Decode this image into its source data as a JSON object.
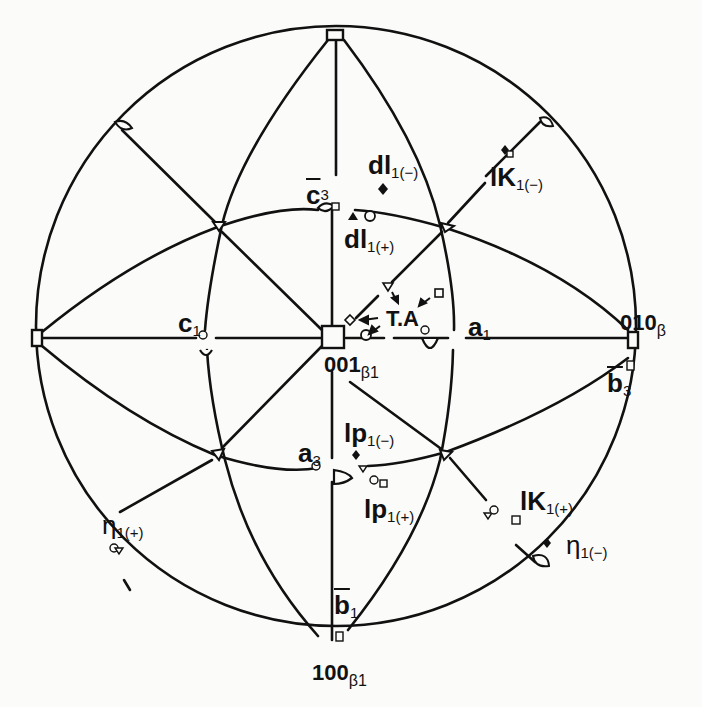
{
  "diagram": {
    "type": "stereographic-projection",
    "background_color": "#fbfbf9",
    "line_color": "#111111",
    "primitive_circle": {
      "cx": 336,
      "cy": 320,
      "r": 300
    },
    "poles": [
      {
        "id": "001",
        "main": "001",
        "sub": "β1",
        "x": 331,
        "y": 338
      },
      {
        "id": "010",
        "main": "010",
        "sub": "β",
        "x": 631,
        "y": 338
      },
      {
        "id": "100",
        "main": "100",
        "sub": "β1",
        "x": 331,
        "y": 620
      },
      {
        "id": "top",
        "x": 336,
        "y": 35
      },
      {
        "id": "left",
        "x": 36,
        "y": 338
      }
    ],
    "labels": {
      "pole_001": {
        "main": "001",
        "sub": "β1"
      },
      "pole_010": {
        "main": "010",
        "sub": "β"
      },
      "pole_100": {
        "main": "100",
        "sub": "β1"
      },
      "c3": {
        "main": "c",
        "sub": "3",
        "overbar": true
      },
      "dl1_minus": {
        "main": "dl",
        "sub": "1(−)"
      },
      "dl1_plus": {
        "main": "dl",
        "sub": "1(+)"
      },
      "K1_minus": {
        "main": "lK",
        "sub": "1(−)"
      },
      "K1_plus": {
        "main": "lK",
        "sub": "1(+)"
      },
      "c1": {
        "main": "c",
        "sub": "1"
      },
      "a1": {
        "main": "a",
        "sub": "1"
      },
      "a3": {
        "main": "a",
        "sub": "3"
      },
      "b3": {
        "main": "b",
        "sub": "3",
        "overbar": true
      },
      "b1": {
        "main": "b",
        "sub": "1",
        "overbar": true
      },
      "p1_minus": {
        "main": "lp",
        "sub": "1(−)"
      },
      "p1_plus": {
        "main": "lp",
        "sub": "1(+)"
      },
      "eta1_plus": {
        "main": "η",
        "sub": "1(+)"
      },
      "eta1_minus": {
        "main": "η",
        "sub": "1(−)"
      },
      "ta": {
        "main": "T.A"
      }
    },
    "markers": {
      "legend_meaning": "open circle, filled triangle, filled diamond, open square, open inverted triangle symbols mark orientations",
      "symbols": [
        "open-circle",
        "filled-triangle",
        "filled-diamond",
        "open-square",
        "open-triangle-down",
        "open-diamond"
      ]
    }
  }
}
